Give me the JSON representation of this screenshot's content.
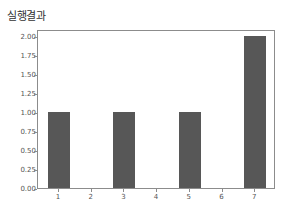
{
  "chart_data": {
    "type": "bar",
    "title": "실행결과",
    "xlabel": "",
    "ylabel": "",
    "categories": [
      1,
      2,
      3,
      4,
      5,
      6,
      7
    ],
    "values": [
      1,
      0,
      1,
      0,
      1,
      0,
      2
    ],
    "ylim": [
      0,
      2.1
    ],
    "xlim": [
      0.6,
      7.4
    ],
    "yticks": [
      "0.00",
      "0.25",
      "0.50",
      "0.75",
      "1.00",
      "1.25",
      "1.50",
      "1.75",
      "2.00"
    ],
    "xticks": [
      "1",
      "2",
      "3",
      "4",
      "5",
      "6",
      "7"
    ],
    "bar_color": "#575757",
    "grid": false,
    "legend": null
  },
  "title": "실행결과"
}
